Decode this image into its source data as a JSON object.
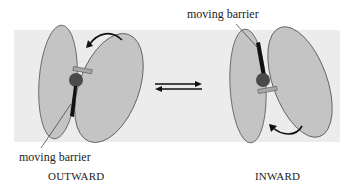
{
  "figure": {
    "left_panel": {
      "state_label": "OUTWARD",
      "annotation": "moving barrier"
    },
    "right_panel": {
      "state_label": "INWARD",
      "annotation": "moving barrier"
    },
    "equilibrium_arrows": "reversible transition (⇄)"
  },
  "colors": {
    "band_background": "#ececec",
    "lobe_fill": "#c4c4c4",
    "lobe_stroke": "#555555",
    "gate_ball": "#4a4a4a",
    "barrier": "#111111",
    "lid_fill": "#a8a8a8",
    "arrow": "#111111"
  }
}
